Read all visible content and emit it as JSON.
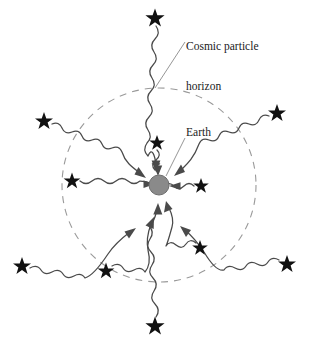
{
  "figure": {
    "background_color": "#ffffff",
    "width": 311,
    "height": 344
  },
  "labels": {
    "horizon": "Cosmic particle\nhorizon",
    "horizon_line1": "Cosmic particle",
    "horizon_line2": "horizon",
    "earth": "Earth"
  },
  "colors": {
    "ink": "#3a3a3a",
    "star": "#111111",
    "earth_fill": "#8a8a8a",
    "earth_stroke": "#6e6e6e",
    "horizon_dash": "#9a9a9a",
    "leader": "#7a7a7a",
    "text": "#1a1a1a"
  },
  "horizon_circle": {
    "center_x": 159,
    "center_y": 185,
    "radius": 97,
    "style": "dashed",
    "dash": "7 6"
  },
  "earth": {
    "center_x": 159,
    "center_y": 185,
    "radius": 10,
    "label": "Earth"
  },
  "leaders": [
    {
      "name": "horizon-leader",
      "x1": 185,
      "y1": 42,
      "x2": 155,
      "y2": 88
    },
    {
      "name": "earth-leader",
      "x1": 185,
      "y1": 138,
      "x2": 165,
      "y2": 176
    }
  ],
  "stars": [
    {
      "id": "star-top",
      "x": 155,
      "y": 17,
      "size": 8.5,
      "inside_horizon": false
    },
    {
      "id": "star-top-left",
      "x": 44,
      "y": 120,
      "size": 8.0,
      "inside_horizon": false
    },
    {
      "id": "star-top-right",
      "x": 277,
      "y": 112,
      "size": 8.0,
      "inside_horizon": false
    },
    {
      "id": "star-left",
      "x": 72,
      "y": 180,
      "size": 7.5,
      "inside_horizon": true
    },
    {
      "id": "star-bottom-left",
      "x": 22,
      "y": 265,
      "size": 8.0,
      "inside_horizon": false
    },
    {
      "id": "star-bottom-right",
      "x": 287,
      "y": 263,
      "size": 8.0,
      "inside_horizon": false
    },
    {
      "id": "star-bottom",
      "x": 155,
      "y": 325,
      "size": 8.5,
      "inside_horizon": false
    },
    {
      "id": "star-lower-left",
      "x": 106,
      "y": 270,
      "size": 7.5,
      "inside_horizon": true
    },
    {
      "id": "star-lower-right",
      "x": 200,
      "y": 247,
      "size": 7.0,
      "inside_horizon": true
    },
    {
      "id": "star-inner-top",
      "x": 157,
      "y": 142,
      "size": 7.0,
      "inside_horizon": true
    },
    {
      "id": "star-inner-right",
      "x": 201,
      "y": 185,
      "size": 7.0,
      "inside_horizon": true
    }
  ],
  "photon_rays": [
    {
      "id": "ray-top",
      "from_star": "star-top",
      "to": "earth",
      "direction": "down"
    },
    {
      "id": "ray-top-left",
      "from_star": "star-top-left",
      "to": "earth",
      "direction": "down-right"
    },
    {
      "id": "ray-top-right",
      "from_star": "star-top-right",
      "to": "earth",
      "direction": "down-left"
    },
    {
      "id": "ray-left",
      "from_star": "star-left",
      "to": "earth",
      "direction": "right"
    },
    {
      "id": "ray-bottom-left",
      "from_star": "star-bottom-left",
      "to": "earth",
      "direction": "up-right"
    },
    {
      "id": "ray-bottom-right",
      "from_star": "star-bottom-right",
      "to": "earth",
      "direction": "up-left"
    },
    {
      "id": "ray-bottom",
      "from_star": "star-bottom",
      "to": "earth",
      "direction": "up"
    },
    {
      "id": "ray-lower-left",
      "from_star": "star-lower-left",
      "to": "earth",
      "direction": "up-right"
    },
    {
      "id": "ray-lower-right",
      "from_star": "star-lower-right",
      "to": "earth",
      "direction": "up-left"
    },
    {
      "id": "ray-inner-top",
      "from_star": "star-inner-top",
      "to": "earth",
      "direction": "down"
    },
    {
      "id": "ray-inner-right",
      "from_star": "star-inner-right",
      "to": "earth",
      "direction": "left"
    }
  ]
}
